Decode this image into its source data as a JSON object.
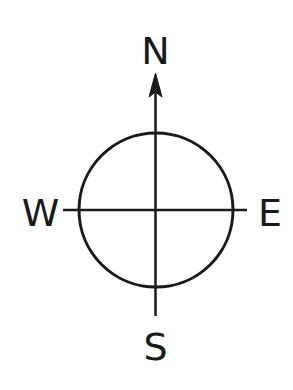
{
  "diagram": {
    "type": "compass-rose",
    "colors": {
      "stroke": "#1a1a1a",
      "background": "#ffffff"
    },
    "labels": {
      "north": "N",
      "east": "E",
      "south": "S",
      "west": "W"
    },
    "arrow": {
      "direction": "north",
      "icon": "arrowhead-icon"
    },
    "circle": {
      "cx": 156,
      "cy": 210,
      "r": 77
    }
  }
}
